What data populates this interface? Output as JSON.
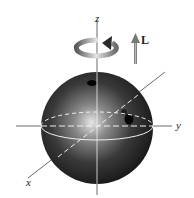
{
  "figure": {
    "axes": {
      "z_label": "z",
      "y_label": "y",
      "x_label": "x"
    },
    "vector_label": "L",
    "colors": {
      "ball_dark": "#1e1e1e",
      "ball_light": "#d8d8d8",
      "axis": "#444444",
      "arrow": "#888888"
    }
  }
}
